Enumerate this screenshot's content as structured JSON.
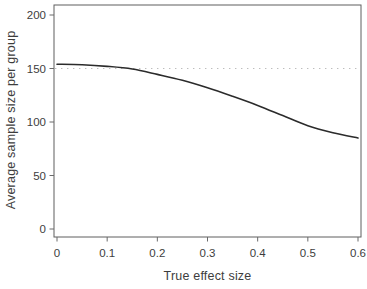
{
  "figure": {
    "background": "#ffffff",
    "frame_color": "#5f5f5f",
    "tick_color": "#6a6a6a",
    "text_color": "#3d3d3d"
  },
  "chart_data": {
    "type": "line",
    "title": "",
    "xlabel": "True effect size",
    "ylabel": "Average sample size per group",
    "xlim": [
      0,
      0.6
    ],
    "ylim": [
      0,
      200
    ],
    "grid": false,
    "legend": "none",
    "x_ticks": [
      0,
      0.1,
      0.2,
      0.3,
      0.4,
      0.5,
      0.6
    ],
    "x_tick_labels": [
      "0",
      "0.1",
      "0.2",
      "0.3",
      "0.4",
      "0.5",
      "0.6"
    ],
    "y_ticks": [
      0,
      50,
      100,
      150,
      200
    ],
    "y_tick_labels": [
      "0",
      "50",
      "100",
      "150",
      "200"
    ],
    "reference_line": {
      "orientation": "horizontal",
      "value": 150,
      "style": "dotted",
      "color": "#bdbdbd"
    },
    "series": [
      {
        "name": "average-sample-size-curve",
        "style": "solid",
        "color": "#2b2b2b",
        "x": [
          0,
          0.05,
          0.1,
          0.15,
          0.2,
          0.25,
          0.3,
          0.35,
          0.4,
          0.45,
          0.5,
          0.55,
          0.6
        ],
        "y": [
          154,
          153.5,
          152,
          149.5,
          144.5,
          139,
          132,
          124,
          115.5,
          106,
          96.5,
          90,
          85
        ]
      }
    ]
  }
}
